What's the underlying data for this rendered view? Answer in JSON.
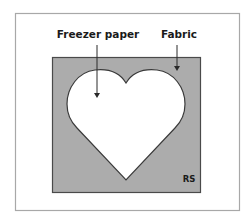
{
  "diagram": {
    "labels": {
      "freezer_paper": "Freezer paper",
      "fabric": "Fabric",
      "side": "RS"
    },
    "colors": {
      "background": "#ffffff",
      "frame_stroke": "#a8a8a8",
      "fabric_fill": "#acacac",
      "fabric_stroke": "#4a4a4a",
      "heart_fill": "#ffffff",
      "heart_stroke": "#3a3a3a",
      "text": "#1a1a1a",
      "arrow": "#2a2a2a"
    }
  }
}
